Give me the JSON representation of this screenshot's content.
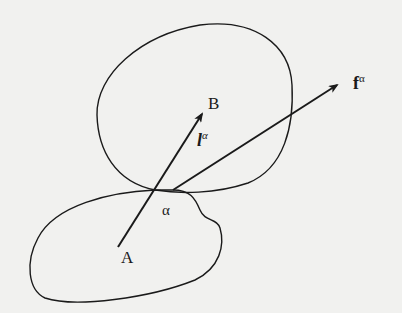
{
  "diagram": {
    "colors": {
      "background": "#f1f1ef",
      "stroke": "#1a1a1a"
    },
    "regions": [
      {
        "id": "upper-body",
        "label": "B"
      },
      {
        "id": "lower-body",
        "label": "A"
      }
    ],
    "contact_point": {
      "label": "α"
    },
    "vectors": [
      {
        "id": "branch-vector",
        "base": "l",
        "superscript": "α",
        "from": "A",
        "to": "B"
      },
      {
        "id": "contact-force",
        "base": "f",
        "superscript": "α",
        "from": "α"
      }
    ],
    "labels": {
      "A": "A",
      "B": "B",
      "alpha": "α",
      "l_base": "l",
      "l_sup": "α",
      "f_base": "f",
      "f_sup": "α"
    }
  }
}
